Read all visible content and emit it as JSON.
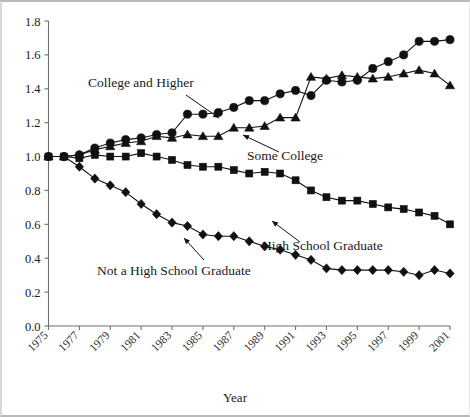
{
  "chart_data": {
    "type": "line",
    "title": "",
    "xlabel": "Year",
    "ylabel": "",
    "xlim": [
      1975,
      2001
    ],
    "ylim": [
      0.0,
      1.8
    ],
    "ytick_labels": [
      "0.0",
      "0.2",
      "0.4",
      "0.6",
      "0.8",
      "1.0",
      "1.2",
      "1.4",
      "1.6",
      "1.8"
    ],
    "ytick_values": [
      0.0,
      0.2,
      0.4,
      0.6,
      0.8,
      1.0,
      1.2,
      1.4,
      1.6,
      1.8
    ],
    "xtick_labels": [
      "1975",
      "1977",
      "1979",
      "1981",
      "1983",
      "1985",
      "1987",
      "1989",
      "1991",
      "1993",
      "1995",
      "1997",
      "1999",
      "2001"
    ],
    "xtick_values": [
      1975,
      1977,
      1979,
      1981,
      1983,
      1985,
      1987,
      1989,
      1991,
      1993,
      1995,
      1997,
      1999,
      2001
    ],
    "xtick_rotation": -45,
    "grid": false,
    "legend_position": "inline-annotations",
    "x": [
      1975,
      1976,
      1977,
      1978,
      1979,
      1980,
      1981,
      1982,
      1983,
      1984,
      1985,
      1986,
      1987,
      1988,
      1989,
      1990,
      1991,
      1992,
      1993,
      1994,
      1995,
      1996,
      1997,
      1998,
      1999,
      2000,
      2001
    ],
    "series": [
      {
        "name": "College and Higher",
        "marker": "circle",
        "values": [
          1.0,
          1.0,
          1.01,
          1.05,
          1.08,
          1.1,
          1.11,
          1.13,
          1.14,
          1.25,
          1.25,
          1.26,
          1.29,
          1.33,
          1.33,
          1.37,
          1.39,
          1.36,
          1.45,
          1.44,
          1.45,
          1.52,
          1.56,
          1.6,
          1.68,
          1.68,
          1.69
        ]
      },
      {
        "name": "Some College",
        "marker": "triangle",
        "values": [
          1.0,
          1.0,
          1.01,
          1.04,
          1.06,
          1.08,
          1.09,
          1.12,
          1.11,
          1.13,
          1.12,
          1.12,
          1.17,
          1.17,
          1.18,
          1.23,
          1.23,
          1.47,
          1.46,
          1.48,
          1.47,
          1.46,
          1.47,
          1.49,
          1.51,
          1.49,
          1.42
        ]
      },
      {
        "name": "High School Graduate",
        "marker": "square",
        "values": [
          1.0,
          1.0,
          0.99,
          1.01,
          1.0,
          1.0,
          1.02,
          1.0,
          0.98,
          0.95,
          0.94,
          0.94,
          0.92,
          0.9,
          0.91,
          0.9,
          0.86,
          0.8,
          0.76,
          0.74,
          0.74,
          0.72,
          0.7,
          0.69,
          0.67,
          0.65,
          0.6
        ]
      },
      {
        "name": "Not a High School Graduate",
        "marker": "diamond",
        "values": [
          1.0,
          1.0,
          0.94,
          0.87,
          0.83,
          0.79,
          0.72,
          0.66,
          0.61,
          0.59,
          0.54,
          0.53,
          0.53,
          0.5,
          0.47,
          0.45,
          0.42,
          0.39,
          0.34,
          0.33,
          0.33,
          0.33,
          0.33,
          0.32,
          0.3,
          0.33,
          0.31
        ]
      }
    ],
    "annotations": [
      {
        "id": "college-and-higher",
        "text": "College and Higher",
        "x": 88,
        "y": 87
      },
      {
        "id": "some-college",
        "text": "Some College",
        "x": 247,
        "y": 160
      },
      {
        "id": "high-school-graduate",
        "text": "High School Graduate",
        "x": 262,
        "y": 250
      },
      {
        "id": "not-a-high-school-graduate",
        "text": "Not a High School Graduate",
        "x": 97,
        "y": 275
      }
    ],
    "colors": {
      "line": "#111111",
      "marker": "#111111",
      "axis": "#6f6f6f",
      "text": "#1a1a1a",
      "background": "#ffffff"
    }
  }
}
